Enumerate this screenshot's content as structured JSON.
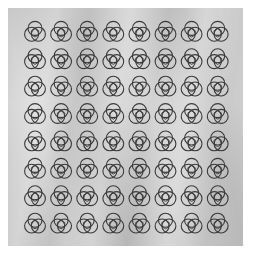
{
  "scene": {
    "description": "8x8 grid of three-ring interlaced line motifs printed on a crumpled silver-gray surface",
    "background_color": "#ffffff",
    "surface_color": "#cecece",
    "line_color": "#3a3a3a"
  },
  "grid": {
    "rows": 8,
    "columns": 8,
    "origin_x": 35,
    "origin_y": 32,
    "step_x": 26.1,
    "step_y": 27.4,
    "motif": {
      "name": "three-ring-knot",
      "ring_radius": 7,
      "ring_offset": 4,
      "inner_shape": "hexagon"
    }
  }
}
